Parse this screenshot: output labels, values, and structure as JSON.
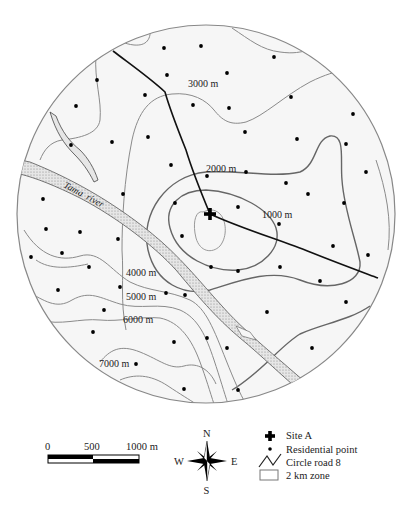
{
  "map": {
    "circle": {
      "cx": 206,
      "cy": 214,
      "r": 189,
      "fill": "#f5f5f5",
      "stroke": "#888888"
    },
    "contour_labels": [
      {
        "text": "3000 m",
        "x": 188,
        "y": 87
      },
      {
        "text": "2000 m",
        "x": 206,
        "y": 172
      },
      {
        "text": "1000 m",
        "x": 262,
        "y": 218
      },
      {
        "text": "4000 m",
        "x": 126,
        "y": 276
      },
      {
        "text": "5000 m",
        "x": 126,
        "y": 300
      },
      {
        "text": "6000 m",
        "x": 123,
        "y": 323
      },
      {
        "text": "7000 m",
        "x": 99,
        "y": 367
      }
    ],
    "river_label": "Tama  river",
    "site_label": "Site A",
    "residential_points": [
      [
        164,
        48
      ],
      [
        201,
        46
      ],
      [
        274,
        57
      ],
      [
        97,
        80
      ],
      [
        167,
        75
      ],
      [
        227,
        73
      ],
      [
        76,
        106
      ],
      [
        145,
        95
      ],
      [
        193,
        105
      ],
      [
        229,
        108
      ],
      [
        291,
        97
      ],
      [
        353,
        114
      ],
      [
        71,
        145
      ],
      [
        112,
        142
      ],
      [
        148,
        137
      ],
      [
        245,
        132
      ],
      [
        297,
        139
      ],
      [
        346,
        144
      ],
      [
        171,
        165
      ],
      [
        207,
        176
      ],
      [
        246,
        172
      ],
      [
        286,
        183
      ],
      [
        366,
        172
      ],
      [
        43,
        199
      ],
      [
        123,
        194
      ],
      [
        175,
        203
      ],
      [
        238,
        207
      ],
      [
        308,
        194
      ],
      [
        344,
        203
      ],
      [
        46,
        229
      ],
      [
        80,
        232
      ],
      [
        118,
        239
      ],
      [
        182,
        236
      ],
      [
        279,
        224
      ],
      [
        31,
        257
      ],
      [
        62,
        253
      ],
      [
        89,
        267
      ],
      [
        211,
        267
      ],
      [
        238,
        271
      ],
      [
        280,
        267
      ],
      [
        333,
        246
      ],
      [
        368,
        255
      ],
      [
        58,
        290
      ],
      [
        120,
        287
      ],
      [
        166,
        293
      ],
      [
        185,
        295
      ],
      [
        320,
        281
      ],
      [
        346,
        302
      ],
      [
        104,
        310
      ],
      [
        267,
        312
      ],
      [
        93,
        332
      ],
      [
        174,
        342
      ],
      [
        207,
        338
      ],
      [
        227,
        348
      ],
      [
        312,
        348
      ],
      [
        136,
        364
      ],
      [
        184,
        389
      ],
      [
        238,
        390
      ]
    ],
    "colors": {
      "contour": "#8a8a8a",
      "contour_dark": "#666666",
      "road": "#111111",
      "river_fill": "#d8d8d8",
      "dot": "#000000"
    }
  },
  "legend": {
    "scale_bar": {
      "ticks": [
        "0",
        "500",
        "1000 m"
      ]
    },
    "compass": {
      "n": "N",
      "s": "S",
      "e": "E",
      "w": "W"
    },
    "items": [
      {
        "symbol": "cross",
        "label": "Site A"
      },
      {
        "symbol": "dot",
        "label": "Residential point"
      },
      {
        "symbol": "road",
        "label": "Circle road 8"
      },
      {
        "symbol": "box",
        "label": "2 km zone"
      }
    ]
  }
}
